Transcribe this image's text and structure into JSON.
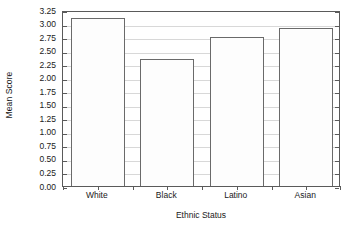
{
  "chart_data": {
    "type": "bar",
    "title": "",
    "subtitle": "",
    "xlabel": "Ethnic Status",
    "ylabel": "Mean Score",
    "categories": [
      "White",
      "Black",
      "Latino",
      "Asian"
    ],
    "values": [
      3.1,
      2.35,
      2.76,
      2.91
    ],
    "series": [
      {
        "name": "Mean Score",
        "values": [
          3.1,
          2.35,
          2.76,
          2.91
        ]
      }
    ],
    "ylim": [
      0.0,
      3.25
    ],
    "ytick_step": 0.25,
    "ytick_labels": [
      "3.25",
      "3.00",
      "2.75",
      "2.50",
      "2.25",
      "2.00",
      "1.75",
      "1.50",
      "1.25",
      "1.00",
      "0.75",
      "0.50",
      "0.25",
      "0.00"
    ],
    "ytick_values": [
      3.25,
      3.0,
      2.75,
      2.5,
      2.25,
      2.0,
      1.75,
      1.5,
      1.25,
      1.0,
      0.75,
      0.5,
      0.25,
      0.0
    ],
    "grid": true,
    "grid_axis": "y",
    "legend": false,
    "legend_position": "none",
    "annotations": [],
    "colors": {
      "bar_fill": "#fdfdfd",
      "bar_stroke": "#6a6a6a",
      "axis": "#5a5a5a",
      "gridline": "#d8d8d8",
      "text": "#1a1a1a",
      "background": "#ffffff"
    }
  }
}
